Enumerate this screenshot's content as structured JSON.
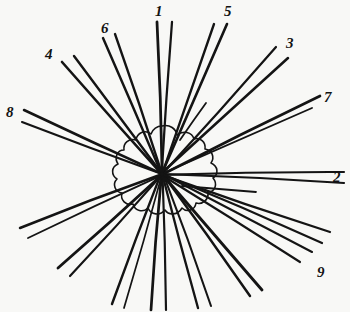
{
  "figure": {
    "background_color": "#f8f8f6",
    "ink_color": "#141414",
    "width": 350,
    "height": 312,
    "center": {
      "x": 162,
      "y": 174
    }
  },
  "chart_data": {
    "type": "scatter",
    "xlabel": "",
    "ylabel": "",
    "categories": [
      "1",
      "2",
      "3",
      "4",
      "5",
      "6",
      "7",
      "8",
      "9"
    ],
    "values": [
      1,
      2,
      3,
      4,
      5,
      6,
      7,
      8,
      9
    ],
    "annotations": [
      "1",
      "2",
      "3",
      "4",
      "5",
      "6",
      "7",
      "8",
      "9"
    ],
    "grid": false,
    "legend": "none"
  },
  "labels": [
    {
      "id": "1",
      "text": "1",
      "x": 155,
      "y": 4,
      "angle_deg": -88
    },
    {
      "id": "2",
      "text": "2",
      "x": 333,
      "y": 170,
      "angle_deg": 2
    },
    {
      "id": "3",
      "text": "3",
      "x": 286,
      "y": 36,
      "angle_deg": -40
    },
    {
      "id": "4",
      "text": "4",
      "x": 45,
      "y": 47,
      "angle_deg": -135
    },
    {
      "id": "5",
      "text": "5",
      "x": 224,
      "y": 4,
      "angle_deg": -70
    },
    {
      "id": "6",
      "text": "6",
      "x": 101,
      "y": 21,
      "angle_deg": -110
    },
    {
      "id": "7",
      "text": "7",
      "x": 324,
      "y": 90,
      "angle_deg": -18
    },
    {
      "id": "8",
      "text": "8",
      "x": 6,
      "y": 105,
      "angle_deg": -160
    },
    {
      "id": "9",
      "text": "9",
      "x": 317,
      "y": 265,
      "angle_deg": 40
    }
  ],
  "rays": [
    {
      "name": "ray-1-north",
      "label": "1",
      "outer_x": 157,
      "outer_y": 22,
      "inner_x": 172,
      "inner_y": 22,
      "count": 2
    },
    {
      "name": "ray-2-east",
      "label": "2",
      "outer_x": 344,
      "outer_y": 172,
      "inner_x": 344,
      "inner_y": 183,
      "count": 2
    },
    {
      "name": "ray-3-northeast",
      "label": "3",
      "outer_x": 288,
      "outer_y": 58,
      "inner_x": 276,
      "inner_y": 47,
      "count": 2
    },
    {
      "name": "ray-4-northwest",
      "label": "4",
      "outer_x": 62,
      "outer_y": 62,
      "inner_x": 74,
      "inner_y": 56,
      "count": 2
    },
    {
      "name": "ray-5-north-northeast",
      "label": "5",
      "outer_x": 227,
      "outer_y": 24,
      "inner_x": 214,
      "inner_y": 24,
      "count": 2
    },
    {
      "name": "ray-6-north-northwest",
      "label": "6",
      "outer_x": 103,
      "outer_y": 38,
      "inner_x": 115,
      "inner_y": 34,
      "count": 2
    },
    {
      "name": "ray-7-east-northeast",
      "label": "7",
      "outer_x": 320,
      "outer_y": 96,
      "inner_x": 312,
      "inner_y": 108,
      "count": 2
    },
    {
      "name": "ray-8-west-northwest",
      "label": "8",
      "outer_x": 24,
      "outer_y": 110,
      "inner_x": 22,
      "inner_y": 122,
      "count": 2
    },
    {
      "name": "ray-9-southeast",
      "label": "9",
      "outer_x": 312,
      "outer_y": 252,
      "inner_x": 300,
      "inner_y": 262,
      "count": 2
    },
    {
      "name": "ray-south",
      "label": "",
      "outer_x": 151,
      "outer_y": 310,
      "inner_x": 166,
      "inner_y": 310,
      "count": 2
    },
    {
      "name": "ray-south-southwest",
      "label": "",
      "outer_x": 112,
      "outer_y": 304,
      "inner_x": 124,
      "inner_y": 308,
      "count": 2
    },
    {
      "name": "ray-southwest",
      "label": "",
      "outer_x": 58,
      "outer_y": 268,
      "inner_x": 70,
      "inner_y": 276,
      "count": 2
    },
    {
      "name": "ray-west-southwest",
      "label": "",
      "outer_x": 20,
      "outer_y": 228,
      "inner_x": 28,
      "inner_y": 238,
      "count": 2
    },
    {
      "name": "ray-south-southeast",
      "label": "",
      "outer_x": 198,
      "outer_y": 308,
      "inner_x": 211,
      "inner_y": 306,
      "count": 2
    },
    {
      "name": "ray-southeast-inner",
      "label": "",
      "outer_x": 262,
      "outer_y": 290,
      "inner_x": 250,
      "inner_y": 296,
      "count": 2
    },
    {
      "name": "ray-east-southeast",
      "label": "",
      "outer_x": 330,
      "outer_y": 232,
      "inner_x": 322,
      "inner_y": 243,
      "count": 2
    }
  ],
  "stubs": [
    {
      "name": "stub-east-short",
      "x1": 182,
      "y1": 186,
      "x2": 256,
      "y2": 192
    },
    {
      "name": "stub-north-short",
      "x1": 180,
      "y1": 140,
      "x2": 206,
      "y2": 103
    }
  ]
}
